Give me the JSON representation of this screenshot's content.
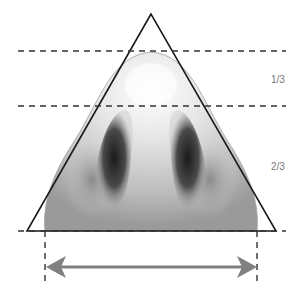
{
  "diagram": {
    "labels": {
      "upper": "1/3",
      "lower": "2/3"
    },
    "colors": {
      "line": "#1a1a1a",
      "dash": "#333333",
      "arrow": "#808080",
      "skin_light": "#f4f4f4",
      "skin_mid": "#c8c8c8",
      "nostril_dark": "#2a2a2a"
    }
  }
}
